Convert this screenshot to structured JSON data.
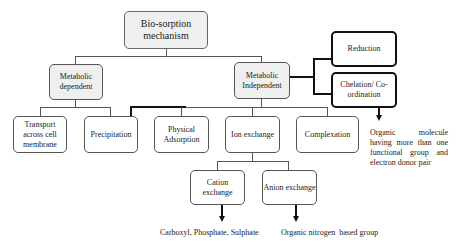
{
  "diagram": {
    "root": {
      "label": "Bio-sorption mechanism"
    },
    "level1": [
      {
        "label": "Metabolic dependent"
      },
      {
        "label": "Metabolic Independent"
      }
    ],
    "right_branch": [
      {
        "label": "Reduction"
      },
      {
        "label": "Chelation/ Co-ordination"
      }
    ],
    "level2": [
      {
        "label": "Transport across cell membrane"
      },
      {
        "label": "Precipitation"
      },
      {
        "label": "Physical Adsorption"
      },
      {
        "label": "Ion exchange"
      },
      {
        "label": "Complexation"
      }
    ],
    "level3": [
      {
        "label": "Cation exchange"
      },
      {
        "label": "Anion exchange"
      }
    ],
    "notes": {
      "chelation": "Organic molecule having more than one functional group and electron donor pair",
      "cation": "Carboxyl, Phosphate, Sulphate",
      "anion": "Organic nitrogen  based group"
    }
  }
}
